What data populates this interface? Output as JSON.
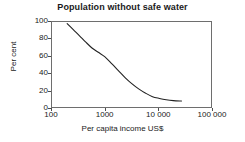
{
  "chart_data": {
    "type": "line",
    "title": "Population without safe water",
    "xlabel": "Per capita income US$",
    "ylabel": "Per cent",
    "xscale": "log",
    "xlim": [
      100,
      100000
    ],
    "ylim": [
      0,
      100
    ],
    "grid": false,
    "legend": null,
    "xticks": [
      {
        "value": 100,
        "label": "100"
      },
      {
        "value": 1000,
        "label": "1000"
      },
      {
        "value": 10000,
        "label": "10 000"
      },
      {
        "value": 100000,
        "label": "100 000"
      }
    ],
    "yticks": [
      {
        "value": 0,
        "label": "0"
      },
      {
        "value": 20,
        "label": "20"
      },
      {
        "value": 40,
        "label": "40"
      },
      {
        "value": 60,
        "label": "60"
      },
      {
        "value": 80,
        "label": "80"
      },
      {
        "value": 100,
        "label": "100"
      }
    ],
    "series": [
      {
        "name": "Population without safe water",
        "color": "#222222",
        "x": [
          200,
          260,
          340,
          440,
          580,
          760,
          1000,
          1350,
          1800,
          2400,
          3200,
          4300,
          5800,
          7800,
          10500,
          14000,
          19000,
          27000
        ],
        "y": [
          97,
          90,
          83,
          76,
          69,
          64,
          59,
          51,
          43,
          35,
          28,
          22,
          17,
          13,
          11,
          9.5,
          8.5,
          8
        ]
      }
    ]
  }
}
